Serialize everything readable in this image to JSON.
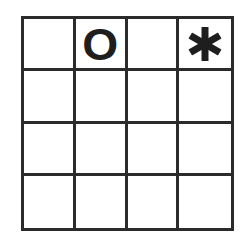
{
  "board": {
    "rows": 4,
    "cols": 4,
    "line_color": "#2b2b2b",
    "mark_color": "#1e1e1e",
    "cells": [
      [
        "",
        "O",
        "",
        "*"
      ],
      [
        "",
        "",
        "",
        ""
      ],
      [
        "",
        "",
        "",
        ""
      ],
      [
        "",
        "",
        "",
        ""
      ]
    ],
    "marks": {
      "O": "circle-letter-o",
      "*": "asterisk-icon"
    }
  },
  "cell_0_0": "",
  "cell_0_1": "O",
  "cell_0_2": "",
  "cell_0_3": "*"
}
